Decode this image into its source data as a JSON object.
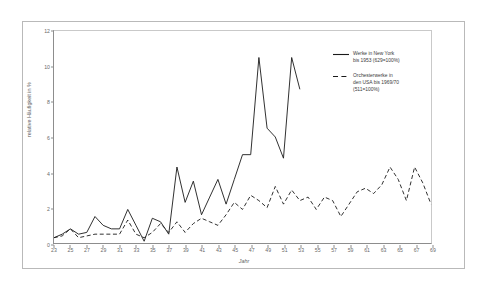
{
  "chart_data": {
    "type": "line",
    "title": "",
    "xlabel": "Jahr",
    "ylabel": "relative Häufigkeit in %",
    "xlim": [
      23,
      69
    ],
    "ylim": [
      0,
      12
    ],
    "xticks": [
      23,
      25,
      27,
      29,
      31,
      33,
      35,
      37,
      39,
      41,
      43,
      45,
      47,
      49,
      51,
      53,
      55,
      57,
      59,
      61,
      63,
      65,
      67,
      69
    ],
    "yticks": [
      0,
      2,
      4,
      6,
      8,
      10,
      12
    ],
    "grid": false,
    "legend_position": "upper-right-inside",
    "x": [
      23,
      24,
      25,
      26,
      27,
      28,
      29,
      30,
      31,
      32,
      33,
      34,
      35,
      36,
      37,
      38,
      39,
      40,
      41,
      42,
      43,
      44,
      45,
      46,
      47,
      48,
      49,
      50,
      51,
      52,
      53
    ],
    "series": [
      {
        "name": "Werke in New York bis 1953 (629=100%)",
        "style": "solid",
        "color": "#1a1a1a",
        "x": [
          23,
          24,
          25,
          26,
          27,
          28,
          29,
          30,
          31,
          32,
          33,
          34,
          35,
          36,
          37,
          38,
          39,
          40,
          41,
          42,
          43,
          44,
          45,
          46,
          47,
          48,
          49,
          50,
          51,
          52,
          53
        ],
        "values": [
          0.3,
          0.5,
          0.8,
          0.5,
          0.6,
          1.5,
          1.0,
          0.8,
          0.8,
          1.9,
          1.0,
          0.1,
          1.4,
          1.2,
          0.5,
          4.3,
          2.3,
          3.5,
          1.6,
          2.6,
          3.6,
          2.2,
          3.6,
          5.0,
          5.0,
          10.5,
          6.5,
          6.0,
          4.8,
          10.5,
          8.7
        ]
      },
      {
        "name": "Orchesterwerke in den USA bis 1969/70 (511=100%)",
        "style": "dashed",
        "color": "#1a1a1a",
        "x": [
          23,
          24,
          25,
          26,
          27,
          28,
          29,
          30,
          31,
          32,
          33,
          34,
          35,
          36,
          37,
          38,
          39,
          40,
          41,
          42,
          43,
          44,
          45,
          46,
          47,
          48,
          49,
          50,
          51,
          52,
          53,
          54,
          55,
          56,
          57,
          58,
          59,
          60,
          61,
          62,
          63,
          64,
          65,
          66,
          67,
          68,
          69
        ],
        "values": [
          0.3,
          0.4,
          0.8,
          0.3,
          0.4,
          0.5,
          0.5,
          0.5,
          0.5,
          1.3,
          0.5,
          0.3,
          0.6,
          1.1,
          0.6,
          1.2,
          0.6,
          1.1,
          1.4,
          1.2,
          1.0,
          1.6,
          2.3,
          1.9,
          2.7,
          2.4,
          2.0,
          3.2,
          2.2,
          3.0,
          2.4,
          2.6,
          1.9,
          2.6,
          2.4,
          1.5,
          2.2,
          2.9,
          3.1,
          2.8,
          3.3,
          4.3,
          3.6,
          2.4,
          4.3,
          3.4,
          2.2
        ]
      }
    ],
    "legend": [
      {
        "key": "solid",
        "line1": "Werke in New York",
        "line2": "bis 1953 (629=100%)"
      },
      {
        "key": "dashed",
        "line1": "Orchesterwerke in",
        "line2": "den USA bis 1969/70",
        "line3": "(511=100%)"
      }
    ]
  }
}
